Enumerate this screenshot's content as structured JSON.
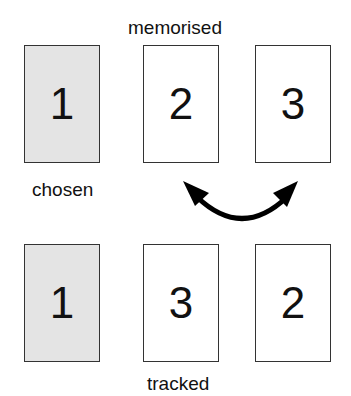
{
  "labels": {
    "top": "memorised",
    "left": "chosen",
    "bottom": "tracked"
  },
  "rows": {
    "top": [
      {
        "number": "1",
        "chosen": true
      },
      {
        "number": "2",
        "chosen": false
      },
      {
        "number": "3",
        "chosen": false
      }
    ],
    "bottom": [
      {
        "number": "1",
        "chosen": true
      },
      {
        "number": "3",
        "chosen": false
      },
      {
        "number": "2",
        "chosen": false
      }
    ]
  },
  "arrow": {
    "type": "double-headed-curved",
    "meaning": "swap"
  },
  "colors": {
    "chosen_fill": "#e4e4e4",
    "card_border": "#333333",
    "arrow": "#000000"
  }
}
